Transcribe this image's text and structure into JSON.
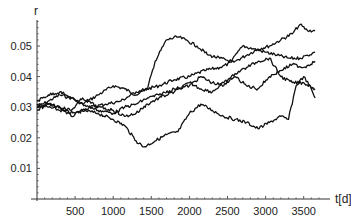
{
  "chart_data": {
    "type": "line",
    "title": "",
    "xlabel": "t[d]",
    "ylabel": "r",
    "xlim": [
      0,
      3700
    ],
    "ylim": [
      0,
      0.0585
    ],
    "grid": false,
    "legend": null,
    "x_ticks": [
      500,
      1000,
      1500,
      2000,
      2500,
      3000,
      3500
    ],
    "x_tick_labels": [
      "500",
      "1000",
      "1500",
      "2000",
      "2500",
      "3000",
      "3500"
    ],
    "y_ticks": [
      0.01,
      0.02,
      0.03,
      0.04,
      0.05
    ],
    "y_tick_labels": [
      "0.01",
      "0.02",
      "0.03",
      "0.04",
      "0.05"
    ],
    "series": [
      {
        "name": "path 1",
        "x": [
          0,
          150,
          300,
          450,
          600,
          800,
          1000,
          1150,
          1300,
          1450,
          1600,
          1800,
          2000,
          2200,
          2400,
          2600,
          2750,
          2900,
          3050,
          3200,
          3350,
          3450,
          3550,
          3650
        ],
        "values": [
          0.03,
          0.032,
          0.034,
          0.033,
          0.031,
          0.034,
          0.037,
          0.036,
          0.034,
          0.036,
          0.037,
          0.039,
          0.04,
          0.042,
          0.043,
          0.045,
          0.047,
          0.049,
          0.05,
          0.052,
          0.054,
          0.057,
          0.055,
          0.055
        ]
      },
      {
        "name": "path 2",
        "x": [
          0,
          150,
          300,
          500,
          700,
          900,
          1100,
          1300,
          1450,
          1550,
          1700,
          1850,
          1950,
          2100,
          2250,
          2400,
          2550,
          2700,
          2850,
          3000,
          3150,
          3300,
          3450,
          3550,
          3650
        ],
        "values": [
          0.031,
          0.03,
          0.029,
          0.028,
          0.03,
          0.031,
          0.032,
          0.035,
          0.036,
          0.045,
          0.052,
          0.053,
          0.052,
          0.05,
          0.047,
          0.046,
          0.045,
          0.05,
          0.049,
          0.048,
          0.047,
          0.046,
          0.046,
          0.047,
          0.048
        ]
      },
      {
        "name": "path 3",
        "x": [
          0,
          150,
          300,
          450,
          600,
          800,
          1000,
          1150,
          1300,
          1400,
          1550,
          1700,
          1850,
          2000,
          2150,
          2300,
          2450,
          2600,
          2750,
          2900,
          3050,
          3200,
          3300,
          3400,
          3500,
          3600,
          3650
        ],
        "values": [
          0.03,
          0.031,
          0.03,
          0.027,
          0.029,
          0.028,
          0.026,
          0.024,
          0.019,
          0.017,
          0.019,
          0.021,
          0.022,
          0.028,
          0.031,
          0.029,
          0.027,
          0.026,
          0.025,
          0.023,
          0.025,
          0.027,
          0.026,
          0.037,
          0.04,
          0.036,
          0.033
        ]
      },
      {
        "name": "path 4",
        "x": [
          0,
          150,
          300,
          450,
          600,
          800,
          1000,
          1150,
          1300,
          1450,
          1600,
          1800,
          2000,
          2150,
          2300,
          2450,
          2600,
          2750,
          2900,
          3050,
          3200,
          3350,
          3500,
          3650
        ],
        "values": [
          0.032,
          0.034,
          0.035,
          0.033,
          0.031,
          0.029,
          0.028,
          0.03,
          0.031,
          0.033,
          0.034,
          0.036,
          0.037,
          0.04,
          0.038,
          0.037,
          0.041,
          0.043,
          0.045,
          0.046,
          0.04,
          0.038,
          0.038,
          0.036
        ]
      },
      {
        "name": "path 5",
        "x": [
          0,
          150,
          300,
          450,
          600,
          800,
          1000,
          1150,
          1300,
          1450,
          1600,
          1800,
          2000,
          2150,
          2300,
          2450,
          2600,
          2750,
          2900,
          3050,
          3200,
          3350,
          3500,
          3650
        ],
        "values": [
          0.029,
          0.031,
          0.03,
          0.029,
          0.033,
          0.03,
          0.029,
          0.027,
          0.028,
          0.031,
          0.033,
          0.035,
          0.038,
          0.036,
          0.035,
          0.038,
          0.04,
          0.037,
          0.036,
          0.04,
          0.042,
          0.044,
          0.043,
          0.045
        ]
      }
    ]
  },
  "layout": {
    "plot_left": 37,
    "plot_bottom": 199,
    "px_per_x_unit": 0.0762,
    "px_per_y_unit": 3060,
    "x_axis_end": 330,
    "y_axis_top": 20
  }
}
